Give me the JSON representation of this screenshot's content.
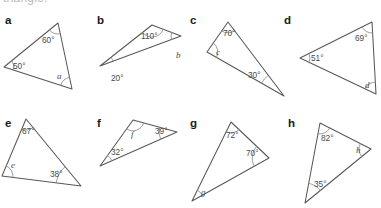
{
  "page": {
    "background_color": "#ffffff",
    "stroke_color": "#58585a",
    "arc_color": "#8d8d90",
    "text_color": "#4a4a4c",
    "letter_color": "#1a1a1a",
    "cut_off_heading": "triangle."
  },
  "problems": [
    {
      "letter": "a",
      "letter_pos": {
        "x": 5,
        "y": 24
      },
      "vertices": [
        {
          "x": 58,
          "y": 23
        },
        {
          "x": 72,
          "y": 89
        },
        {
          "x": 4,
          "y": 67
        }
      ],
      "angles": [
        {
          "label": "60°",
          "type": "value",
          "at": 0,
          "text_pos": {
            "x": 42,
            "y": 43
          },
          "arc_r": 11
        },
        {
          "label": "a",
          "type": "variable",
          "at": 1,
          "text_pos": {
            "x": 57,
            "y": 79
          },
          "arc_r": 12
        },
        {
          "label": "50°",
          "type": "value",
          "at": 2,
          "text_pos": {
            "x": 13,
            "y": 69
          },
          "arc_r": 10
        }
      ]
    },
    {
      "letter": "b",
      "letter_pos": {
        "x": 97,
        "y": 24
      },
      "vertices": [
        {
          "x": 152,
          "y": 25
        },
        {
          "x": 181,
          "y": 36
        },
        {
          "x": 100,
          "y": 66
        }
      ],
      "angles": [
        {
          "label": "110°",
          "type": "value",
          "at": 0,
          "text_pos": {
            "x": 141,
            "y": 39
          },
          "arc_r": 12
        },
        {
          "label": "b",
          "type": "variable",
          "at": 1,
          "text_pos": {
            "x": 176,
            "y": 58
          },
          "arc_r": 10
        },
        {
          "label": "20°",
          "type": "value",
          "at": 2,
          "text_pos": {
            "x": 111,
            "y": 81
          },
          "arc_r": 14
        }
      ]
    },
    {
      "letter": "c",
      "letter_pos": {
        "x": 190,
        "y": 24
      },
      "vertices": [
        {
          "x": 228,
          "y": 22
        },
        {
          "x": 284,
          "y": 96
        },
        {
          "x": 207,
          "y": 52
        }
      ],
      "angles": [
        {
          "label": "70°",
          "type": "value",
          "at": 0,
          "text_pos": {
            "x": 223,
            "y": 36
          },
          "arc_r": 11
        },
        {
          "label": "30°",
          "type": "value",
          "at": 1,
          "text_pos": {
            "x": 248,
            "y": 78
          },
          "arc_r": 26
        },
        {
          "label": "c",
          "type": "variable",
          "at": 2,
          "text_pos": {
            "x": 216,
            "y": 55
          },
          "arc_r": 11
        }
      ]
    },
    {
      "letter": "d",
      "letter_pos": {
        "x": 284,
        "y": 24
      },
      "vertices": [
        {
          "x": 372,
          "y": 22
        },
        {
          "x": 376,
          "y": 94
        },
        {
          "x": 300,
          "y": 58
        }
      ],
      "angles": [
        {
          "label": "69°",
          "type": "value",
          "at": 0,
          "text_pos": {
            "x": 355,
            "y": 41
          },
          "arc_r": 11
        },
        {
          "label": "d",
          "type": "variable",
          "at": 1,
          "text_pos": {
            "x": 365,
            "y": 88
          },
          "arc_r": 12
        },
        {
          "label": "51°",
          "type": "value",
          "at": 2,
          "text_pos": {
            "x": 311,
            "y": 61
          },
          "arc_r": 10
        }
      ]
    },
    {
      "letter": "e",
      "letter_pos": {
        "x": 5,
        "y": 127
      },
      "vertices": [
        {
          "x": 26,
          "y": 119
        },
        {
          "x": 81,
          "y": 186
        },
        {
          "x": 2,
          "y": 176
        }
      ],
      "angles": [
        {
          "label": "67°",
          "type": "value",
          "at": 0,
          "text_pos": {
            "x": 22,
            "y": 134
          },
          "arc_r": 11
        },
        {
          "label": "38°",
          "type": "value",
          "at": 1,
          "text_pos": {
            "x": 50,
            "y": 177
          },
          "arc_r": 25
        },
        {
          "label": "e",
          "type": "variable",
          "at": 2,
          "text_pos": {
            "x": 11,
            "y": 168
          },
          "arc_r": 11
        }
      ]
    },
    {
      "letter": "f",
      "letter_pos": {
        "x": 97,
        "y": 127
      },
      "vertices": [
        {
          "x": 133,
          "y": 120
        },
        {
          "x": 177,
          "y": 132
        },
        {
          "x": 100,
          "y": 166
        }
      ],
      "angles": [
        {
          "label": "f",
          "type": "variable",
          "at": 0,
          "text_pos": {
            "x": 131,
            "y": 137
          },
          "arc_r": 11
        },
        {
          "label": "39°",
          "type": "value",
          "at": 1,
          "text_pos": {
            "x": 155,
            "y": 134
          },
          "arc_r": 18
        },
        {
          "label": "32°",
          "type": "value",
          "at": 2,
          "text_pos": {
            "x": 111,
            "y": 155
          },
          "arc_r": 13
        }
      ]
    },
    {
      "letter": "g",
      "letter_pos": {
        "x": 190,
        "y": 127
      },
      "vertices": [
        {
          "x": 231,
          "y": 122
        },
        {
          "x": 269,
          "y": 158
        },
        {
          "x": 192,
          "y": 201
        }
      ],
      "angles": [
        {
          "label": "72°",
          "type": "value",
          "at": 0,
          "text_pos": {
            "x": 226,
            "y": 138
          },
          "arc_r": 11
        },
        {
          "label": "70°",
          "type": "value",
          "at": 1,
          "text_pos": {
            "x": 246,
            "y": 156
          },
          "arc_r": 17
        },
        {
          "label": "g",
          "type": "variable",
          "at": 2,
          "text_pos": {
            "x": 201,
            "y": 195
          },
          "arc_r": 12
        }
      ]
    },
    {
      "letter": "h",
      "letter_pos": {
        "x": 288,
        "y": 127
      },
      "vertices": [
        {
          "x": 320,
          "y": 123
        },
        {
          "x": 371,
          "y": 149
        },
        {
          "x": 305,
          "y": 203
        }
      ],
      "angles": [
        {
          "label": "82°",
          "type": "value",
          "at": 0,
          "text_pos": {
            "x": 321,
            "y": 141
          },
          "arc_r": 11
        },
        {
          "label": "h",
          "type": "variable",
          "at": 1,
          "text_pos": {
            "x": 356,
            "y": 153
          },
          "arc_r": 12
        },
        {
          "label": "35°",
          "type": "value",
          "at": 2,
          "text_pos": {
            "x": 314,
            "y": 187
          },
          "arc_r": 20
        }
      ]
    }
  ]
}
